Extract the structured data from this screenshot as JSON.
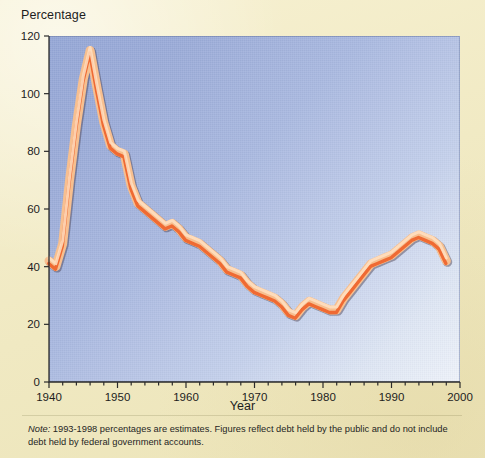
{
  "figure": {
    "y_axis_title": "Percentage",
    "x_axis_title": "Year",
    "note_prefix": "Note:",
    "note_text": " 1993-1998 percentages are estimates. Figures reflect debt held by the public and do not include debt held by federal government accounts."
  },
  "colors": {
    "paper": "#f2ecc8",
    "plot_top_right": "#95a7d6",
    "plot_bottom_left": "#eef2fa",
    "line_core": "#ef6a33",
    "line_halo": "#f7bf8f",
    "axis": "#2b2b2b",
    "text": "#1d1d1d"
  },
  "chart_data": {
    "type": "line",
    "title": "",
    "xlabel": "Year",
    "ylabel": "Percentage",
    "xlim": [
      1940,
      2000
    ],
    "ylim": [
      0,
      120
    ],
    "xticks": [
      1940,
      1950,
      1960,
      1970,
      1980,
      1990,
      2000
    ],
    "yticks": [
      0,
      20,
      40,
      60,
      80,
      100,
      120
    ],
    "xtick_labels": [
      "1940",
      "1950",
      "1960",
      "1970",
      "1980",
      "1990",
      "2000"
    ],
    "ytick_labels": [
      "0",
      "20",
      "40",
      "60",
      "80",
      "100",
      "120"
    ],
    "grid": false,
    "legend": null,
    "series": [
      {
        "name": "Federal debt held by the public as percentage of GDP",
        "x": [
          1940,
          1941,
          1942,
          1943,
          1944,
          1945,
          1946,
          1947,
          1948,
          1949,
          1950,
          1951,
          1952,
          1953,
          1954,
          1955,
          1956,
          1957,
          1958,
          1959,
          1960,
          1961,
          1962,
          1963,
          1964,
          1965,
          1966,
          1967,
          1968,
          1969,
          1970,
          1971,
          1972,
          1973,
          1974,
          1975,
          1976,
          1977,
          1978,
          1979,
          1980,
          1981,
          1982,
          1983,
          1984,
          1985,
          1986,
          1987,
          1988,
          1989,
          1990,
          1991,
          1992,
          1993,
          1994,
          1995,
          1996,
          1997,
          1998
        ],
        "values": [
          42,
          40,
          48,
          70,
          89,
          105,
          115,
          102,
          90,
          82,
          80,
          79,
          68,
          62,
          60,
          58,
          56,
          54,
          55,
          53,
          50,
          49,
          48,
          46,
          44,
          42,
          39,
          38,
          37,
          34,
          32,
          31,
          30,
          29,
          27,
          24,
          23,
          26,
          28,
          27,
          26,
          25,
          25,
          29,
          32,
          35,
          38,
          41,
          42,
          43,
          44,
          46,
          48,
          50,
          51,
          50,
          49,
          47,
          42
        ]
      }
    ],
    "annotations": [
      {
        "text": "Note: 1993-1998 percentages are estimates. Figures reflect debt held by the public and do not include debt held by federal government accounts.",
        "position": "below-axis"
      }
    ]
  }
}
